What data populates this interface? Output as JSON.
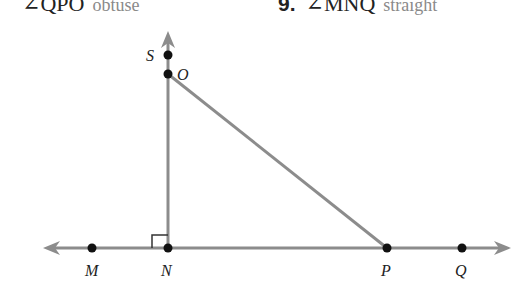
{
  "header": {
    "left_item": {
      "angle": "∠QPO",
      "answer": "obtuse"
    },
    "right_item": {
      "number": "9.",
      "angle": "∠MNQ",
      "answer": "straight"
    }
  },
  "diagram": {
    "line_color": "#8c8c8c",
    "point_color": "#111111",
    "points": {
      "S": {
        "label": "S",
        "x": 168,
        "y": 55
      },
      "O": {
        "label": "O",
        "x": 168,
        "y": 74
      },
      "M": {
        "label": "M",
        "x": 92,
        "y": 248
      },
      "N": {
        "label": "N",
        "x": 168,
        "y": 248
      },
      "P": {
        "label": "P",
        "x": 387,
        "y": 248
      },
      "Q": {
        "label": "Q",
        "x": 462,
        "y": 248
      }
    },
    "right_angle_marker": "N"
  }
}
